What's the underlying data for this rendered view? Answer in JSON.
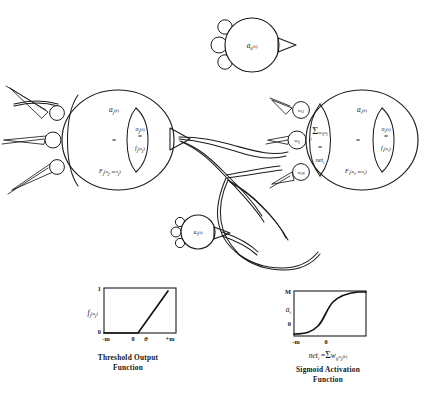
{
  "figure": {
    "background_color": "#ffffff",
    "ink_color": "#1c1c1c"
  },
  "neurons": {
    "sending": {
      "name": "sending-neuron",
      "activation_label": "a",
      "activation_sub": "j",
      "activation_time": "(t)",
      "equals": "=",
      "state_fn": "F",
      "state_fn_sub": "j",
      "state_fn_args": "(a",
      "state_fn_args_sub": "j",
      "state_fn_args2": ", net",
      "state_fn_args2_sub": "j",
      "state_fn_close": ")",
      "output_label": "o",
      "output_sub": "j",
      "output_time": "(t)",
      "output_equals": "=",
      "output_fn": "f",
      "output_fn_sub": "j",
      "output_fn_arg": "(a",
      "output_fn_arg_sub": "j",
      "output_fn_close": ")",
      "input_bumps": 3
    },
    "receiving": {
      "name": "receiving-neuron",
      "activation_label": "a",
      "activation_sub": "i",
      "activation_time": "(t)",
      "equals": "=",
      "state_fn": "F",
      "state_fn_sub": "i",
      "state_fn_args": "(a",
      "state_fn_args_sub": "i",
      "state_fn_args2": ", net",
      "state_fn_args2_sub": "i",
      "state_fn_close": ")",
      "output_label": "o",
      "output_sub": "i",
      "output_time": "(t)",
      "output_equals": "=",
      "output_fn": "f",
      "output_fn_sub": "i",
      "output_fn_arg": "(a",
      "output_fn_arg_sub": "i",
      "output_fn_close": ")",
      "net_sigma": "Σ",
      "net_sigma_sub": "j",
      "net_weight": "w",
      "net_weight_sub": "ij",
      "net_output": "o",
      "net_output_sub": "j",
      "net_equals": "=",
      "net_label": "net",
      "net_label_sub": "i"
    },
    "top": {
      "name": "top-neuron",
      "label": "a",
      "label_sub": "k",
      "label_time": "(t)",
      "input_bumps": 3
    },
    "bottom": {
      "name": "bottom-neuron",
      "label": "a",
      "label_sub": "l",
      "label_time": "(t)",
      "input_bumps": 3
    }
  },
  "weights": [
    {
      "name": "weight-i1",
      "symbol": "w",
      "sub": "i1"
    },
    {
      "name": "weight-ij",
      "symbol": "w",
      "sub": "ij"
    },
    {
      "name": "weight-iN",
      "symbol": "w",
      "sub": "iN"
    }
  ],
  "charts": [
    {
      "id": "threshold-chart",
      "type": "line",
      "title": "Threshold Output\nFunction",
      "caption_line1": "Threshold Output",
      "caption_line2": "Function",
      "ylabel": "f",
      "ylabel_sub": "j",
      "ylabel_arg": "(a",
      "ylabel_arg_sub": "j",
      "ylabel_close": ")",
      "ytick_top": "1",
      "ytick_bottom": "0",
      "xticks": [
        "-m",
        "0",
        "θ",
        "+m"
      ],
      "ylim": [
        0,
        1
      ],
      "x": [
        -1.0,
        -0.05,
        0.55
      ],
      "y": [
        0.0,
        0.0,
        0.93
      ],
      "grid": false,
      "note": "piecewise: flat at 0 until theta then steep linear rise toward 1"
    },
    {
      "id": "sigmoid-chart",
      "type": "line",
      "title": "Sigmoid Activation\nFunction",
      "caption_line1": "Sigmoid Activation",
      "caption_line2": "Function",
      "formula": "net",
      "formula_sub": "i",
      "formula_equals": "=",
      "formula_sigma": "Σ",
      "formula_weight": "w",
      "formula_weight_sub": "ij",
      "formula_out": "o",
      "formula_out_sub": "j",
      "formula_time": "(t)",
      "ylabel": "a",
      "ylabel_sub": "i",
      "ytick_top": "M",
      "ytick_bottom": "0",
      "xticks": [
        "-m",
        "0"
      ],
      "ylim": [
        0,
        1
      ],
      "x": [
        -1.0,
        -0.6,
        -0.3,
        0.0,
        0.3,
        0.6,
        1.0
      ],
      "y": [
        0.01,
        0.05,
        0.2,
        0.5,
        0.8,
        0.95,
        0.99
      ],
      "grid": false,
      "note": "logistic sigmoid from 0 to M centered at 0"
    }
  ]
}
